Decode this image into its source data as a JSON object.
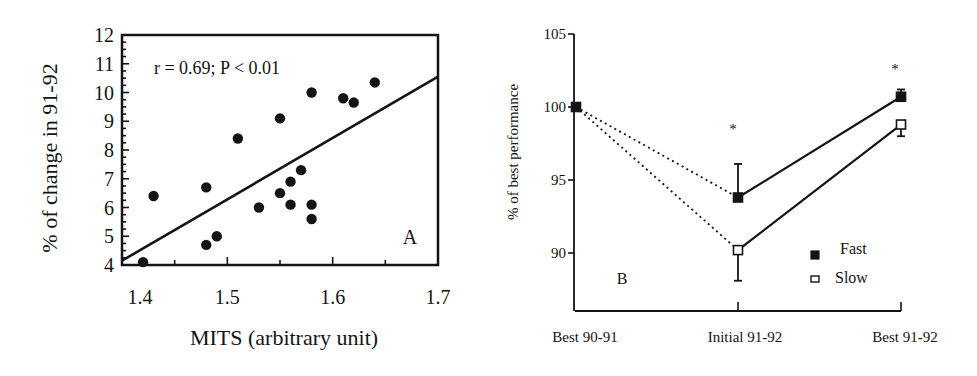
{
  "chart_data": [
    {
      "panel": "A",
      "type": "scatter",
      "xlabel": "MITS (arbitrary unit)",
      "ylabel": "% of change in 91-92",
      "annotation": "r = 0.69; P < 0.01",
      "panel_label": "A",
      "xlim": [
        1.4,
        1.7
      ],
      "ylim": [
        4,
        12
      ],
      "xticks": [
        1.4,
        1.5,
        1.6,
        1.7
      ],
      "xtick_labels": [
        "1.4",
        "1.5",
        "1.6",
        "1.7"
      ],
      "yticks": [
        4,
        5,
        6,
        7,
        8,
        9,
        10,
        11,
        12
      ],
      "ytick_labels": [
        "4",
        "5",
        "6",
        "7",
        "8",
        "9",
        "10",
        "11",
        "12"
      ],
      "grid": false,
      "points": [
        {
          "x": 1.42,
          "y": 4.1
        },
        {
          "x": 1.43,
          "y": 6.4
        },
        {
          "x": 1.48,
          "y": 6.7
        },
        {
          "x": 1.48,
          "y": 4.7
        },
        {
          "x": 1.49,
          "y": 5.0
        },
        {
          "x": 1.51,
          "y": 8.4
        },
        {
          "x": 1.53,
          "y": 6.0
        },
        {
          "x": 1.55,
          "y": 9.1
        },
        {
          "x": 1.55,
          "y": 6.5
        },
        {
          "x": 1.56,
          "y": 6.9
        },
        {
          "x": 1.56,
          "y": 6.1
        },
        {
          "x": 1.57,
          "y": 7.3
        },
        {
          "x": 1.58,
          "y": 10.0
        },
        {
          "x": 1.58,
          "y": 6.1
        },
        {
          "x": 1.58,
          "y": 5.6
        },
        {
          "x": 1.61,
          "y": 9.8
        },
        {
          "x": 1.62,
          "y": 9.65
        },
        {
          "x": 1.64,
          "y": 10.35
        }
      ],
      "regression_line": {
        "x": [
          1.4,
          1.7
        ],
        "y": [
          4.15,
          10.55
        ]
      }
    },
    {
      "panel": "B",
      "type": "line",
      "ylabel": "% of best performance",
      "xlabel": "",
      "panel_label": "B",
      "categories": [
        "Best 90-91",
        "Initial 91-92",
        "Best 91-92"
      ],
      "ylim": [
        86.5,
        105
      ],
      "yticks": [
        90,
        95,
        100,
        105
      ],
      "ytick_labels": [
        "90",
        "95",
        "100",
        "105"
      ],
      "grid": false,
      "legend": {
        "position": "lower right",
        "entries": [
          "Fast",
          "Slow"
        ]
      },
      "series": [
        {
          "name": "Fast",
          "marker": "filled-square",
          "values": [
            100,
            93.8,
            100.7
          ],
          "error_up": [
            null,
            2.3,
            0.5
          ],
          "error_down": [
            null,
            null,
            null
          ]
        },
        {
          "name": "Slow",
          "marker": "open-square",
          "values": [
            100,
            90.2,
            98.8
          ],
          "error_up": [
            null,
            null,
            null
          ],
          "error_down": [
            null,
            2.1,
            0.8
          ]
        }
      ],
      "line_style": {
        "segment_1": "dotted",
        "segment_2": "solid"
      },
      "significance_markers": [
        {
          "category": "Initial 91-92",
          "label": "*"
        },
        {
          "category": "Best 91-92",
          "label": "*"
        }
      ]
    }
  ]
}
